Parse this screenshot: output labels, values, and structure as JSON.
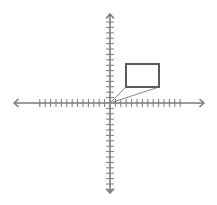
{
  "diagram": {
    "type": "coordinate-plane",
    "background": "#ffffff",
    "axis_color": "#7a7a7a",
    "shape_color": "#5a5a5a",
    "line_color": "#8a8a8a",
    "origin_px": [
      110,
      103
    ],
    "x_axis": {
      "from_px": 14,
      "to_px": 204,
      "ticks_left": 13,
      "ticks_right": 13,
      "tick_spacing_px": 5.4
    },
    "y_axis": {
      "from_px": 14,
      "to_px": 193,
      "ticks_up": 15,
      "ticks_down": 16,
      "tick_spacing_px": 5.4
    },
    "rectangle": {
      "x": 126,
      "y": 64,
      "width": 33,
      "height": 23
    },
    "rays": [
      {
        "from": [
          110,
          103
        ],
        "to": [
          126,
          87
        ]
      },
      {
        "from": [
          110,
          103
        ],
        "to": [
          159,
          87
        ]
      }
    ],
    "labels": []
  }
}
